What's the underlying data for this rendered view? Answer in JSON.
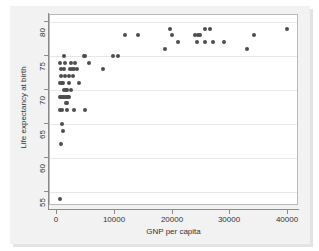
{
  "chart_data": {
    "type": "scatter",
    "title": "",
    "xlabel": "GNP per capita",
    "ylabel": "Life expectancy at birth",
    "xlim": [
      -1200,
      41500
    ],
    "ylim": [
      53.2,
      81.0
    ],
    "xticks": [
      0,
      10000,
      20000,
      30000,
      40000
    ],
    "xtick_labels": [
      "0",
      "10000",
      "20000",
      "30000",
      "40000"
    ],
    "yticks": [
      55,
      60,
      65,
      70,
      75,
      80
    ],
    "ytick_labels": [
      "55",
      "60",
      "65",
      "70",
      "75",
      "80"
    ],
    "grid": "horizontal",
    "legend": "none",
    "marker": {
      "shape": "circle",
      "color": "#4d4d4d",
      "size_px": 4
    },
    "point_count": 67,
    "points": [
      {
        "x": 600,
        "y": 54
      },
      {
        "x": 700,
        "y": 62
      },
      {
        "x": 1100,
        "y": 64
      },
      {
        "x": 900,
        "y": 65
      },
      {
        "x": 600,
        "y": 67
      },
      {
        "x": 900,
        "y": 67
      },
      {
        "x": 1700,
        "y": 67
      },
      {
        "x": 3000,
        "y": 67
      },
      {
        "x": 4800,
        "y": 67
      },
      {
        "x": 1600,
        "y": 68
      },
      {
        "x": 1700,
        "y": 68
      },
      {
        "x": 500,
        "y": 69
      },
      {
        "x": 700,
        "y": 69
      },
      {
        "x": 900,
        "y": 69
      },
      {
        "x": 1100,
        "y": 69
      },
      {
        "x": 1300,
        "y": 69
      },
      {
        "x": 1500,
        "y": 69
      },
      {
        "x": 1700,
        "y": 69
      },
      {
        "x": 1900,
        "y": 69
      },
      {
        "x": 2100,
        "y": 69
      },
      {
        "x": 1200,
        "y": 70
      },
      {
        "x": 1500,
        "y": 70
      },
      {
        "x": 1800,
        "y": 70
      },
      {
        "x": 2400,
        "y": 70
      },
      {
        "x": 600,
        "y": 71
      },
      {
        "x": 900,
        "y": 71
      },
      {
        "x": 1100,
        "y": 71
      },
      {
        "x": 2000,
        "y": 71
      },
      {
        "x": 3800,
        "y": 71
      },
      {
        "x": 700,
        "y": 72
      },
      {
        "x": 1400,
        "y": 72
      },
      {
        "x": 2100,
        "y": 72
      },
      {
        "x": 2800,
        "y": 72
      },
      {
        "x": 700,
        "y": 73
      },
      {
        "x": 1300,
        "y": 73
      },
      {
        "x": 2300,
        "y": 73
      },
      {
        "x": 2600,
        "y": 73
      },
      {
        "x": 3000,
        "y": 73
      },
      {
        "x": 3400,
        "y": 73
      },
      {
        "x": 500,
        "y": 74
      },
      {
        "x": 1400,
        "y": 74
      },
      {
        "x": 2400,
        "y": 74
      },
      {
        "x": 3100,
        "y": 74
      },
      {
        "x": 5600,
        "y": 74
      },
      {
        "x": 7900,
        "y": 73
      },
      {
        "x": 1300,
        "y": 75
      },
      {
        "x": 4700,
        "y": 75
      },
      {
        "x": 4900,
        "y": 75
      },
      {
        "x": 9700,
        "y": 75
      },
      {
        "x": 10600,
        "y": 75
      },
      {
        "x": 11800,
        "y": 78
      },
      {
        "x": 14000,
        "y": 78
      },
      {
        "x": 18600,
        "y": 76
      },
      {
        "x": 19500,
        "y": 79
      },
      {
        "x": 19900,
        "y": 78
      },
      {
        "x": 21000,
        "y": 77
      },
      {
        "x": 23900,
        "y": 78
      },
      {
        "x": 24300,
        "y": 78
      },
      {
        "x": 24700,
        "y": 78
      },
      {
        "x": 24200,
        "y": 77
      },
      {
        "x": 25600,
        "y": 79
      },
      {
        "x": 25600,
        "y": 77
      },
      {
        "x": 26500,
        "y": 79
      },
      {
        "x": 26900,
        "y": 77
      },
      {
        "x": 28900,
        "y": 77
      },
      {
        "x": 32900,
        "y": 76
      },
      {
        "x": 34100,
        "y": 78
      },
      {
        "x": 39800,
        "y": 79
      }
    ]
  }
}
